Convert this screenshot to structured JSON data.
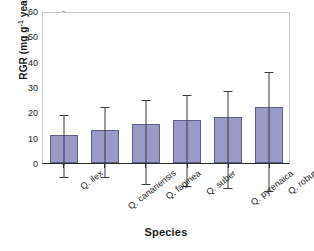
{
  "chart_data": {
    "type": "bar",
    "title": "",
    "xlabel": "Species",
    "ylabel": "RGR (mg g-1 year-1)",
    "ylabel_parts": {
      "prefix": "RGR (mg g",
      "sup1": "-1",
      "mid": " year",
      "sup2": "-1",
      "suffix": ")"
    },
    "categories": [
      "Q. ilex",
      "Q. canariensis",
      "Q. faginea",
      "Q. suber",
      "Q. pyrenaica",
      "Q. robur"
    ],
    "values": [
      11,
      13,
      15.5,
      17,
      18,
      22
    ],
    "err_low": [
      4.5,
      6.5,
      6.5,
      7,
      7.5,
      10
    ],
    "err_high": [
      29,
      34.5,
      39.5,
      43,
      45.5,
      57
    ],
    "ylim": [
      0,
      60
    ],
    "yticks": [
      0,
      10,
      20,
      30,
      40,
      50,
      60
    ],
    "ytick_labels": [
      "0",
      "10",
      "20",
      "30",
      "40",
      "50",
      "60"
    ],
    "grid": false,
    "legend": false,
    "bar_color": "#9a9ac9",
    "bar_border_color": "#5d5d86",
    "error_color": "#3a3a3a",
    "axis_color": "#2b2b2b",
    "frame_color": "#c9c9c9"
  }
}
